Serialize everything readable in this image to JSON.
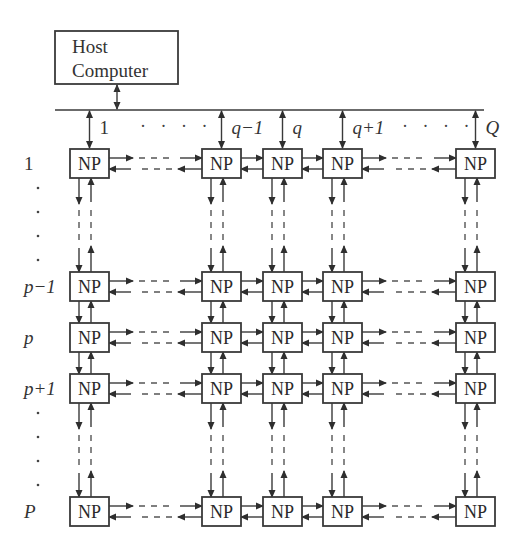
{
  "host": {
    "line1": "Host",
    "line2": "Computer"
  },
  "node_label": "NP",
  "column_labels": [
    {
      "text": "1",
      "italic": false
    },
    {
      "text": "q−1",
      "italic": true
    },
    {
      "text": "q",
      "italic": true
    },
    {
      "text": "q+1",
      "italic": true
    },
    {
      "text": "Q",
      "italic": true
    }
  ],
  "row_labels": [
    {
      "text": "1",
      "italic": false
    },
    {
      "text": "p−1",
      "italic": true
    },
    {
      "text": "p",
      "italic": true
    },
    {
      "text": "p+1",
      "italic": true
    },
    {
      "text": "P",
      "italic": true
    }
  ],
  "ellipsis": {
    "horizontal": "· · · ·",
    "vertical": "⋮"
  },
  "layout": {
    "host_box": [
      55,
      31,
      123,
      53
    ],
    "bus_y": 110,
    "bus_x": [
      55,
      484
    ],
    "col_x": [
      70,
      202,
      263,
      323,
      456
    ],
    "row_y": [
      149,
      272,
      323,
      374,
      497
    ],
    "box_w": 39,
    "box_h": 29,
    "gap_after_col": [
      0,
      3
    ],
    "gap_after_row": [
      0,
      3
    ]
  },
  "colors": {
    "line": "#3a3a3a",
    "text": "#333333",
    "background": "#ffffff"
  }
}
